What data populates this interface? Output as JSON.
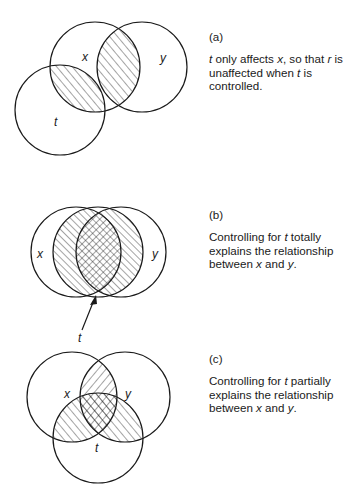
{
  "panels": [
    {
      "id": "a",
      "label": "(a)",
      "caption_parts": [
        "",
        "t",
        " only affects ",
        "x",
        ", so that ",
        "r",
        " is unaffected when ",
        "t",
        " is controlled."
      ],
      "circles": {
        "x": "x",
        "y": "y",
        "t": "t"
      }
    },
    {
      "id": "b",
      "label": "(b)",
      "caption_parts": [
        "Controlling for ",
        "t",
        " totally explains the relationship between ",
        "x",
        " and ",
        "y",
        "."
      ],
      "circles": {
        "x": "x",
        "y": "y",
        "t": "t"
      }
    },
    {
      "id": "c",
      "label": "(c)",
      "caption_parts": [
        "Controlling for ",
        "t",
        " partially explains the relationship between ",
        "x",
        " and ",
        "y",
        "."
      ],
      "circles": {
        "x": "x",
        "y": "y",
        "t": "t"
      }
    }
  ],
  "colors": {
    "ink": "#1a1a1a",
    "background": "#ffffff"
  }
}
